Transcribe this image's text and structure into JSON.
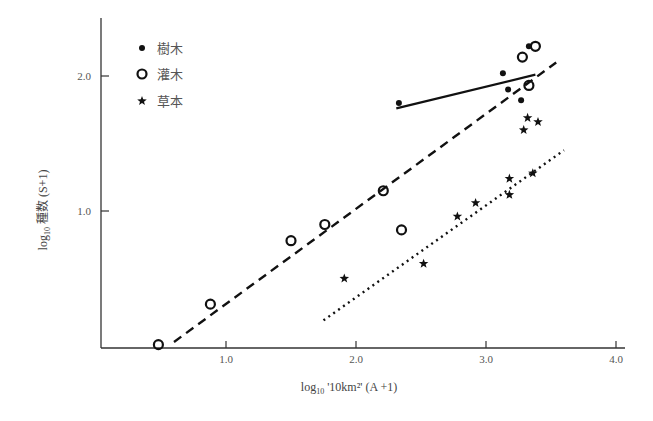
{
  "chart_data": {
    "type": "scatter",
    "title": "",
    "xlabel": "log₁₀ '10km²' (A +1)",
    "ylabel": "log₁₀ 種数 (S+1)",
    "xlim": [
      0,
      4.1
    ],
    "ylim": [
      0,
      2.5
    ],
    "x_ticks": [
      "1.0",
      "2.0",
      "3.0",
      "4.0"
    ],
    "x_tick_values": [
      1.0,
      2.0,
      3.0,
      4.0
    ],
    "y_ticks": [
      "1.0",
      "2.0"
    ],
    "y_tick_values": [
      1.0,
      2.0
    ],
    "grid": false,
    "legend_position": "upper-left",
    "series": [
      {
        "name": "樹木",
        "marker": "dot",
        "line_style": "solid",
        "points": [
          [
            2.33,
            1.8
          ],
          [
            3.13,
            2.02
          ],
          [
            3.17,
            1.9
          ],
          [
            3.27,
            1.82
          ],
          [
            3.33,
            2.22
          ]
        ],
        "fit_line": [
          [
            2.31,
            1.76
          ],
          [
            3.38,
            2.01
          ]
        ]
      },
      {
        "name": "灌木",
        "marker": "circle",
        "line_style": "dashed",
        "points": [
          [
            0.48,
            0.01
          ],
          [
            0.88,
            0.31
          ],
          [
            1.5,
            0.78
          ],
          [
            1.76,
            0.9
          ],
          [
            2.21,
            1.15
          ],
          [
            2.35,
            0.86
          ],
          [
            3.28,
            2.14
          ],
          [
            3.38,
            2.22
          ],
          [
            3.33,
            1.93
          ]
        ],
        "fit_line": [
          [
            0.6,
            0.03
          ],
          [
            3.54,
            2.1
          ]
        ]
      },
      {
        "name": "草本",
        "marker": "star",
        "line_style": "dotted",
        "points": [
          [
            1.91,
            0.5
          ],
          [
            2.52,
            0.61
          ],
          [
            2.78,
            0.96
          ],
          [
            2.92,
            1.06
          ],
          [
            3.18,
            1.24
          ],
          [
            3.18,
            1.12
          ],
          [
            3.36,
            1.28
          ],
          [
            3.32,
            1.69
          ],
          [
            3.4,
            1.66
          ],
          [
            3.29,
            1.6
          ]
        ],
        "fit_line": [
          [
            1.75,
            0.19
          ],
          [
            3.6,
            1.45
          ]
        ]
      }
    ]
  },
  "legend": {
    "items": [
      {
        "label": "樹木",
        "marker": "dot"
      },
      {
        "label": "灌木",
        "marker": "circle"
      },
      {
        "label": "草本",
        "marker": "star"
      }
    ]
  },
  "axes": {
    "x_title_prefix": "log",
    "x_title_sub": "10",
    "x_title_rest": " '10km²' (A +1)",
    "y_title_prefix": "log",
    "y_title_sub": "10",
    "y_title_rest": " 種数 (S+1)"
  }
}
